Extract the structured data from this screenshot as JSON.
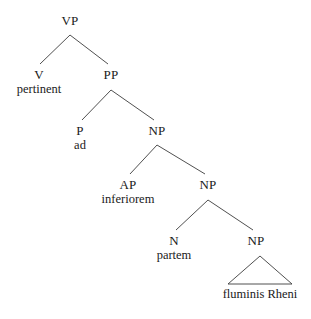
{
  "figure": {
    "kind": "syntax-tree",
    "line_color": "#3c3c3c",
    "text_color": "#1a1a1a",
    "background_color": "#ffffff"
  },
  "nodes": {
    "vp": {
      "label": "VP",
      "x": 70,
      "y": 14
    },
    "v": {
      "label": "V",
      "word": "pertinent",
      "x": 39,
      "y": 68
    },
    "pp": {
      "label": "PP",
      "x": 111,
      "y": 68
    },
    "p": {
      "label": "P",
      "word": "ad",
      "x": 80,
      "y": 124
    },
    "np1": {
      "label": "NP",
      "x": 157,
      "y": 124
    },
    "ap": {
      "label": "AP",
      "word": "inferiorem",
      "x": 128,
      "y": 178
    },
    "np2": {
      "label": "NP",
      "x": 208,
      "y": 178
    },
    "n": {
      "label": "N",
      "word": "partem",
      "x": 174,
      "y": 234
    },
    "np3": {
      "label": "NP",
      "x": 256,
      "y": 234
    },
    "phrase": {
      "word": "fluminis Rheni",
      "x": 260,
      "y": 287
    }
  },
  "edges": [
    {
      "from": "vp",
      "to": "v",
      "x1": 70,
      "y1": 35,
      "x2": 40,
      "y2": 64
    },
    {
      "from": "vp",
      "to": "pp",
      "x1": 70,
      "y1": 35,
      "x2": 108,
      "y2": 64
    },
    {
      "from": "pp",
      "to": "p",
      "x1": 111,
      "y1": 90,
      "x2": 82,
      "y2": 120
    },
    {
      "from": "pp",
      "to": "np1",
      "x1": 111,
      "y1": 90,
      "x2": 154,
      "y2": 120
    },
    {
      "from": "np1",
      "to": "ap",
      "x1": 157,
      "y1": 145,
      "x2": 130,
      "y2": 174
    },
    {
      "from": "np1",
      "to": "np2",
      "x1": 157,
      "y1": 145,
      "x2": 205,
      "y2": 174
    },
    {
      "from": "np2",
      "to": "n",
      "x1": 208,
      "y1": 200,
      "x2": 176,
      "y2": 230
    },
    {
      "from": "np2",
      "to": "np3",
      "x1": 208,
      "y1": 200,
      "x2": 253,
      "y2": 230
    }
  ],
  "triangle": {
    "apex_x": 260,
    "apex_y": 256,
    "left_x": 228,
    "right_x": 292,
    "base_y": 284
  }
}
